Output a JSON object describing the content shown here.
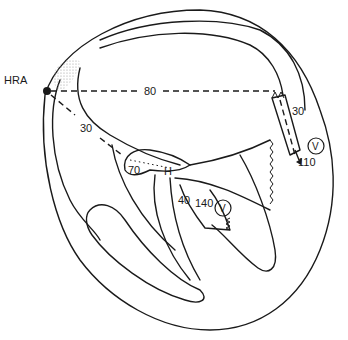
{
  "diagram": {
    "title": "",
    "labels": {
      "hra": "HRA",
      "hra_to_right": "80",
      "hra_to_his": "30",
      "his_node": "70",
      "his_marker": "H",
      "left_bundle": "40",
      "left_bundle_v": "140",
      "v_left": "V",
      "right_top": "30",
      "right_bottom": "110",
      "v_right": "V"
    },
    "colors": {
      "line": "#1a1a1a",
      "background": "#ffffff",
      "stipple": "#9a9a9a"
    }
  }
}
